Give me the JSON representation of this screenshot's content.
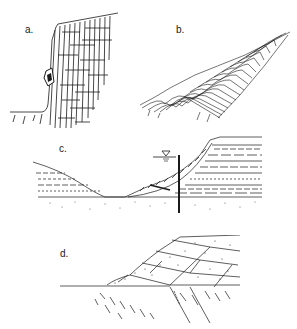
{
  "figure": {
    "panels": [
      {
        "id": "a",
        "label": "a.",
        "description": "Steep jointed rock cliff with a toppling/falling block on its face"
      },
      {
        "id": "b",
        "label": "b.",
        "description": "Slope with thin strata bending downslope (creep / flexural toppling)"
      },
      {
        "id": "c",
        "label": "c.",
        "description": "Valley cross-section with landslide mass on layered slope, water table symbol and borehole line"
      },
      {
        "id": "d",
        "label": "d.",
        "description": "Slope in bedded rock with displaced slide blocks along bedding planes"
      }
    ],
    "symbols": {
      "water_table": "▽"
    },
    "colors": {
      "ink": "#1a1a1a",
      "background": "#ffffff"
    }
  }
}
